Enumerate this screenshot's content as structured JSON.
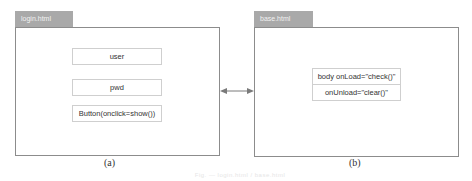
{
  "panels": [
    {
      "id": "a",
      "tab_label": "login.html",
      "items": [
        "user",
        "pwd",
        "Button(onclick=show())"
      ],
      "sublabel": "(a)"
    },
    {
      "id": "b",
      "tab_label": "base.html",
      "items": [
        "body onLoad=\"check()\"",
        "onUnload=\"clear()\""
      ],
      "sublabel": "(b)"
    }
  ],
  "connector": {
    "type": "double-headed-arrow",
    "color": "#7a7a7a"
  },
  "caption": "Fig. — login.html / base.html"
}
